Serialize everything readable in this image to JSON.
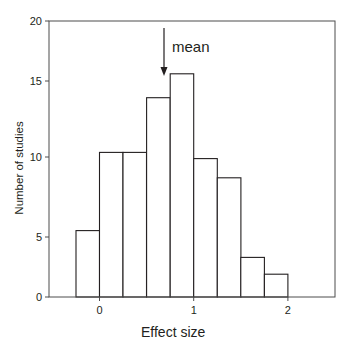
{
  "chart_data": {
    "type": "bar",
    "subtype": "histogram",
    "title": "",
    "xlabel": "Effect size",
    "ylabel": "Number of studies",
    "bin_width": 0.25,
    "bins": [
      {
        "x0": -0.25,
        "x1": 0.0,
        "value": 5.4
      },
      {
        "x0": 0.0,
        "x1": 0.25,
        "value": 10.3
      },
      {
        "x0": 0.25,
        "x1": 0.5,
        "value": 10.3
      },
      {
        "x0": 0.5,
        "x1": 0.75,
        "value": 13.9
      },
      {
        "x0": 0.75,
        "x1": 1.0,
        "value": 15.6
      },
      {
        "x0": 1.0,
        "x1": 1.25,
        "value": 9.9
      },
      {
        "x0": 1.25,
        "x1": 1.5,
        "value": 8.7
      },
      {
        "x0": 1.5,
        "x1": 1.75,
        "value": 3.3
      },
      {
        "x0": 1.75,
        "x1": 2.0,
        "value": 1.9
      }
    ],
    "categories": [
      "-0.25–0",
      "0–0.25",
      "0.25–0.5",
      "0.5–0.75",
      "0.75–1",
      "1–1.25",
      "1.25–1.5",
      "1.5–1.75",
      "1.75–2"
    ],
    "values": [
      5.4,
      10.3,
      10.3,
      13.9,
      15.6,
      9.9,
      8.7,
      3.3,
      1.9
    ],
    "xlim": [
      -0.53,
      2.5
    ],
    "ylim": [
      0,
      20
    ],
    "xticks": [
      "0",
      "1",
      "2"
    ],
    "yticks": [
      "0",
      "5",
      "10",
      "15",
      "20"
    ],
    "grid": false,
    "legend": null,
    "annotations": [
      {
        "text": "mean",
        "type": "arrow-down",
        "x": 0.7
      }
    ],
    "colors": {
      "bar_fill": "#ffffff",
      "bar_edge": "#231f20",
      "axis": "#4d4d4d"
    }
  }
}
